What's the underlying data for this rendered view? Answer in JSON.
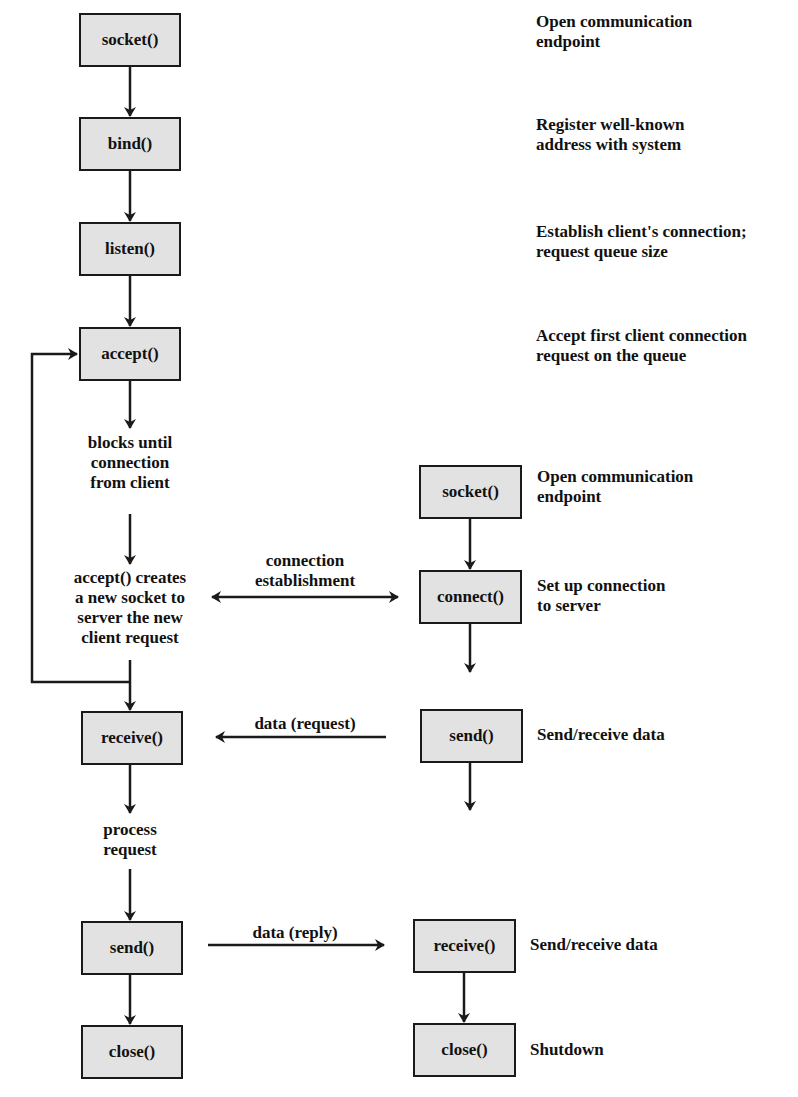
{
  "server": {
    "socket": "socket()",
    "bind": "bind()",
    "listen": "listen()",
    "accept": "accept()",
    "receive": "receive()",
    "send": "send()",
    "close": "close()"
  },
  "client": {
    "socket": "socket()",
    "connect": "connect()",
    "send": "send()",
    "receive": "receive()",
    "close": "close()"
  },
  "server_descriptions": {
    "socket": [
      "Open communication",
      "endpoint"
    ],
    "bind": [
      "Register well-known",
      "address with system"
    ],
    "listen": [
      "Establish client's connection;",
      "request queue size"
    ],
    "accept": [
      "Accept first client connection",
      "request on the queue"
    ]
  },
  "client_descriptions": {
    "socket": [
      "Open communication",
      "endpoint"
    ],
    "connect": [
      "Set up connection",
      "to server"
    ],
    "send": "Send/receive data",
    "receive": "Send/receive data",
    "close": "Shutdown"
  },
  "notes": {
    "blocks": [
      "blocks until",
      "connection",
      "from client"
    ],
    "accept_creates": [
      "accept() creates",
      "a new socket to",
      "server the new",
      "client request"
    ],
    "process": [
      "process",
      "request"
    ]
  },
  "arrows": {
    "connection": [
      "connection",
      "establishment"
    ],
    "data_request": "data (request)",
    "data_reply": "data (reply)"
  },
  "colors": {
    "box_fill": "#e2e2e2",
    "line": "#1a1a1a"
  }
}
